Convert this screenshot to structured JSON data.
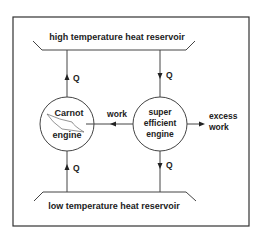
{
  "diagram": {
    "colors": {
      "line": "#444444",
      "frame": "#333333",
      "text": "#222222",
      "background": "#ffffff"
    },
    "high_reservoir": {
      "label": "high temperature heat reservoir"
    },
    "low_reservoir": {
      "label": "low temperature heat reservoir"
    },
    "carnot_engine": {
      "line1": "Carnot",
      "line2": "engine"
    },
    "super_engine": {
      "line1": "super",
      "line2": "efficient",
      "line3": "engine"
    },
    "flows": {
      "carnot_top_q": "Q",
      "super_top_q": "Q",
      "carnot_bottom_q": "Q",
      "super_bottom_q": "Q",
      "work": "work",
      "excess_work_line1": "excess",
      "excess_work_line2": "work"
    }
  }
}
